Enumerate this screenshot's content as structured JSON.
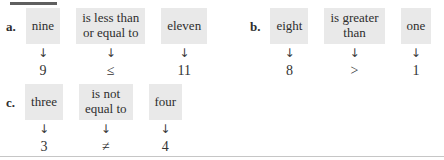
{
  "page": {
    "background_color": "#ffffff",
    "box_background_color": "#e9e9e9",
    "text_color": "#2e2e2e",
    "top_rule_color": "#5f5f5f",
    "bottom_rule_color": "#c6c6c6"
  },
  "glyphs": {
    "down_arrow": "↓"
  },
  "problems": [
    {
      "label": "a.",
      "items": [
        {
          "words": "nine",
          "symbol": "9"
        },
        {
          "words": "is less than\nor equal to",
          "symbol": "≤"
        },
        {
          "words": "eleven",
          "symbol": "11"
        }
      ]
    },
    {
      "label": "b.",
      "items": [
        {
          "words": "eight",
          "symbol": "8"
        },
        {
          "words": "is greater\nthan",
          "symbol": ">"
        },
        {
          "words": "one",
          "symbol": "1"
        }
      ]
    },
    {
      "label": "c.",
      "items": [
        {
          "words": "three",
          "symbol": "3"
        },
        {
          "words": "is not\nequal to",
          "symbol": "≠"
        },
        {
          "words": "four",
          "symbol": "4"
        }
      ]
    }
  ]
}
